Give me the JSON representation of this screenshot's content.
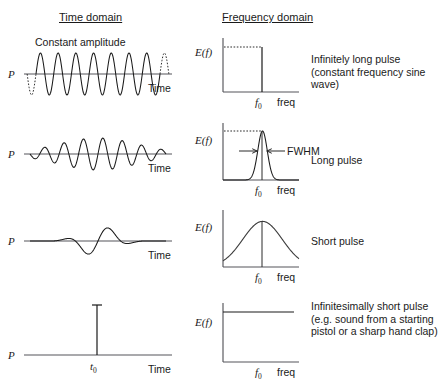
{
  "headers": {
    "time_domain": "Time domain",
    "frequency_domain": "Frequency domain"
  },
  "axis_labels": {
    "power": "P",
    "energy": "E(f)",
    "time": "Time",
    "freq": "freq",
    "f_zero_base": "f",
    "f_zero_sub": "0",
    "t_zero_base": "t",
    "t_zero_sub": "0"
  },
  "annotations": {
    "constant_amplitude": "Constant amplitude",
    "fwhm": "FWHM"
  },
  "colors": {
    "ink": "#1a1a1a",
    "axis": "#55555a",
    "background": "#ffffff"
  },
  "rows": [
    {
      "id": "infinitely-long-pulse",
      "caption": "Infinitely long pulse (constant frequency sine wave)",
      "time_plot": {
        "type": "sine-wave",
        "envelope": "constant",
        "cycles": 7,
        "amplitude": 21,
        "dashed_ends": true,
        "annotation": "Constant amplitude"
      },
      "freq_plot": {
        "type": "delta-line",
        "peak_relative_height": 0.84,
        "peak_x_fraction": 0.52,
        "dotted_level_line": true
      }
    },
    {
      "id": "long-pulse",
      "caption": "Long pulse",
      "time_plot": {
        "type": "gaussian-modulated-sine",
        "cycles": 7,
        "amplitude": 16,
        "envelope_width": 0.42,
        "dashed_ends": false
      },
      "freq_plot": {
        "type": "gaussian",
        "peak_relative_height": 0.86,
        "peak_x_fraction": 0.52,
        "sigma_fraction": 0.062,
        "dotted_level_line": true,
        "fwhm_arrows": true,
        "center_line": true
      }
    },
    {
      "id": "short-pulse",
      "caption": "Short pulse",
      "time_plot": {
        "type": "gaussian-modulated-sine",
        "cycles": 3,
        "amplitude": 16,
        "envelope_width": 0.17,
        "dashed_ends": false
      },
      "freq_plot": {
        "type": "gaussian",
        "peak_relative_height": 0.8,
        "peak_x_fraction": 0.52,
        "sigma_fraction": 0.26,
        "dotted_level_line": false,
        "fwhm_arrows": false,
        "center_line": true
      }
    },
    {
      "id": "infinitesimally-short-pulse",
      "caption": "Infinitesimally short pulse (e.g. sound from a starting pistol or a sharp hand clap)",
      "time_plot": {
        "type": "impulse",
        "spike_x_fraction": 0.52,
        "spike_height": 48,
        "serif_cap": true
      },
      "freq_plot": {
        "type": "flat",
        "level_relative_height": 0.78
      }
    }
  ],
  "chart_data": {
    "type": "line",
    "panels": [
      {
        "row": 1,
        "time": {
          "xlabel": "Time",
          "ylabel": "P",
          "description": "constant amplitude sine wave extending infinitely"
        },
        "freq": {
          "xlabel": "freq",
          "ylabel": "E(f)",
          "description": "single spectral line at f0",
          "x_tick": "f0"
        }
      },
      {
        "row": 2,
        "time": {
          "xlabel": "Time",
          "ylabel": "P",
          "description": "long gaussian-enveloped wave packet"
        },
        "freq": {
          "xlabel": "freq",
          "ylabel": "E(f)",
          "description": "narrow gaussian centred at f0 with FWHM marked",
          "x_tick": "f0"
        }
      },
      {
        "row": 3,
        "time": {
          "xlabel": "Time",
          "ylabel": "P",
          "description": "short gaussian-enveloped wave packet"
        },
        "freq": {
          "xlabel": "freq",
          "ylabel": "E(f)",
          "description": "broad gaussian centred at f0",
          "x_tick": "f0"
        }
      },
      {
        "row": 4,
        "time": {
          "xlabel": "Time",
          "ylabel": "P",
          "description": "single impulse spike at t0",
          "x_tick": "t0"
        },
        "freq": {
          "xlabel": "freq",
          "ylabel": "E(f)",
          "description": "flat, uniform spectrum across all frequencies",
          "x_tick": "f0"
        }
      }
    ]
  }
}
